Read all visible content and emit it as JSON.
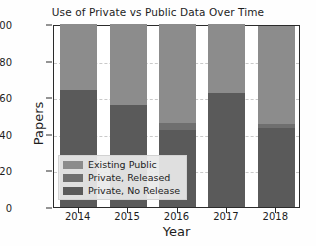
{
  "chart_data": {
    "type": "bar",
    "title": "Use of Private vs Public Data Over Time",
    "xlabel": "Year",
    "ylabel": "Papers",
    "categories": [
      "2014",
      "2015",
      "2016",
      "2017",
      "2018"
    ],
    "ylim": [
      0,
      100
    ],
    "yticks": [
      0,
      20,
      40,
      60,
      80,
      100
    ],
    "grid": true,
    "stacked": true,
    "legend_position": "lower left",
    "series": [
      {
        "name": "Private, No Release",
        "color": "#5a5a5a",
        "values": [
          64,
          56,
          42,
          62.5,
          43
        ]
      },
      {
        "name": "Private, Released",
        "color": "#6f6f6f",
        "values": [
          0,
          0,
          4,
          0,
          2.5
        ]
      },
      {
        "name": "Existing Public",
        "color": "#8c8c8c",
        "values": [
          36,
          44,
          54,
          37.5,
          53.5
        ]
      }
    ],
    "totals": [
      100,
      100,
      100,
      100,
      99
    ]
  },
  "legend": {
    "items": [
      {
        "label": "Existing Public",
        "color": "#8c8c8c"
      },
      {
        "label": "Private, Released",
        "color": "#6f6f6f"
      },
      {
        "label": "Private, No Release",
        "color": "#5a5a5a"
      }
    ]
  }
}
